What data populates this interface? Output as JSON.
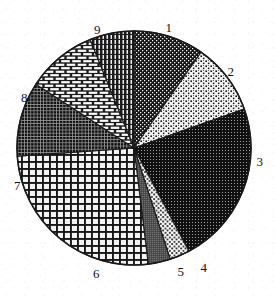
{
  "chart_data": {
    "type": "pie",
    "title": "",
    "subtitle": "",
    "xlabel": "",
    "ylabel": "",
    "legend_position": "none",
    "grid": false,
    "labels_outside": true,
    "start_angle_deg": 90,
    "direction": "clockwise",
    "categories": [
      "1",
      "2",
      "3",
      "4",
      "5",
      "6",
      "7",
      "8",
      "9"
    ],
    "values": [
      9.7,
      9.9,
      22.6,
      2.8,
      3.1,
      25.8,
      10.3,
      9.7,
      6.1
    ],
    "angles_deg": [
      35,
      35.5,
      81.5,
      10,
      11,
      93,
      37,
      35,
      22
    ],
    "slices": [
      {
        "label": "1",
        "value": 9.7,
        "angle_deg": 35,
        "start_deg": 90,
        "end_deg": 55,
        "fill": "dark-dotted-grid",
        "tone": "#1c1c1c",
        "label_x": 172,
        "label_y": 29
      },
      {
        "label": "2",
        "value": 9.9,
        "angle_deg": 35.5,
        "start_deg": 55,
        "end_deg": 19.5,
        "fill": "light-speckle",
        "tone": "#e8e8e8",
        "label_x": 234,
        "label_y": 73
      },
      {
        "label": "3",
        "value": 22.6,
        "angle_deg": 81.5,
        "start_deg": 19.5,
        "end_deg": -62,
        "fill": "dark-dense-grid",
        "tone": "#171717",
        "label_x": 263,
        "label_y": 163
      },
      {
        "label": "4",
        "value": 2.8,
        "angle_deg": 10,
        "start_deg": -62,
        "end_deg": -72,
        "fill": "light-dots",
        "tone": "#f0f0f0",
        "label_x": 207,
        "label_y": 269
      },
      {
        "label": "5",
        "value": 3.1,
        "angle_deg": 11,
        "start_deg": -72,
        "end_deg": -83,
        "fill": "mid-gray",
        "tone": "#5a5a5a",
        "label_x": 184,
        "label_y": 273
      },
      {
        "label": "6",
        "value": 25.8,
        "angle_deg": 93,
        "start_deg": -83,
        "end_deg": -176,
        "fill": "coarse-crosshatch",
        "tone": "#cfcfcf",
        "label_x": 93,
        "label_y": 275
      },
      {
        "label": "7",
        "value": 10.3,
        "angle_deg": 37,
        "start_deg": -176,
        "end_deg": 147,
        "fill": "fine-dark-grid",
        "tone": "#222222",
        "label_x": 14,
        "label_y": 187
      },
      {
        "label": "8",
        "value": 9.7,
        "angle_deg": 35,
        "start_deg": 147,
        "end_deg": 112,
        "fill": "brick",
        "tone": "#dcdcdc",
        "label_x": 21,
        "label_y": 99
      },
      {
        "label": "9",
        "value": 6.1,
        "angle_deg": 22,
        "start_deg": 112,
        "end_deg": 90,
        "fill": "vertical-hatch",
        "tone": "#2b2b2b",
        "label_x": 94,
        "label_y": 31
      }
    ],
    "geometry": {
      "center_x": 134,
      "center_y": 148,
      "radius": 117
    },
    "colors": {
      "stroke": "#1a1a1a",
      "background": "#ffffff",
      "label_text": "#111111"
    }
  }
}
